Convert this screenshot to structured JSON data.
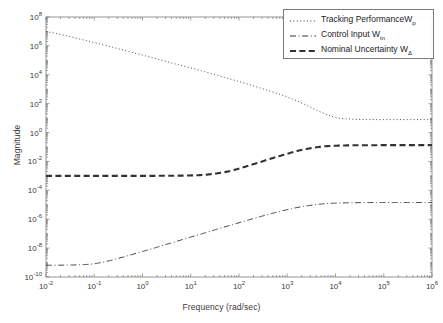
{
  "chart_data": {
    "type": "line",
    "title": "",
    "xlabel": "Frequency (rad/sec)",
    "ylabel": "Magnitude",
    "xscale": "log",
    "yscale": "log",
    "xlim": [
      0.01,
      1000000
    ],
    "ylim": [
      1e-10,
      100000000.0
    ],
    "grid": false,
    "legend_position": "top-right",
    "xticks": [
      {
        "value": 0.01,
        "label_base": "10",
        "label_exp": "-2"
      },
      {
        "value": 0.1,
        "label_base": "10",
        "label_exp": "-1"
      },
      {
        "value": 1,
        "label_base": "10",
        "label_exp": "0"
      },
      {
        "value": 10,
        "label_base": "10",
        "label_exp": "1"
      },
      {
        "value": 100,
        "label_base": "10",
        "label_exp": "2"
      },
      {
        "value": 1000,
        "label_base": "10",
        "label_exp": "3"
      },
      {
        "value": 10000,
        "label_base": "10",
        "label_exp": "4"
      },
      {
        "value": 100000,
        "label_base": "10",
        "label_exp": "5"
      },
      {
        "value": 1000000,
        "label_base": "10",
        "label_exp": "6"
      }
    ],
    "yticks": [
      {
        "value": 100000000.0,
        "label_base": "10",
        "label_exp": "8"
      },
      {
        "value": 1000000.0,
        "label_base": "10",
        "label_exp": "6"
      },
      {
        "value": 10000.0,
        "label_base": "10",
        "label_exp": "4"
      },
      {
        "value": 100.0,
        "label_base": "10",
        "label_exp": "2"
      },
      {
        "value": 1.0,
        "label_base": "10",
        "label_exp": "0"
      },
      {
        "value": 0.01,
        "label_base": "10",
        "label_exp": "-2"
      },
      {
        "value": 0.0001,
        "label_base": "10",
        "label_exp": "-4"
      },
      {
        "value": 1e-06,
        "label_base": "10",
        "label_exp": "-6"
      },
      {
        "value": 1e-08,
        "label_base": "10",
        "label_exp": "-8"
      },
      {
        "value": 1e-10,
        "label_base": "10",
        "label_exp": "-10"
      }
    ],
    "series": [
      {
        "name": "Tracking Performance W_p",
        "legend_text": "Tracking PerformanceW",
        "legend_sub": "p",
        "style": "dotted",
        "color": "#444444",
        "x": [
          0.01,
          0.02,
          0.05,
          0.1,
          0.2,
          0.5,
          1,
          2,
          5,
          10,
          20,
          50,
          100,
          200,
          500,
          1000,
          2000,
          5000,
          10000,
          20000,
          50000,
          100000,
          300000,
          1000000
        ],
        "y": [
          10000000.0,
          6200000.0,
          3000000.0,
          1700000.0,
          950000.0,
          420000.0,
          230000.0,
          125000.0,
          54000.0,
          30000.0,
          16000.0,
          6600.0,
          3400.0,
          1700.0,
          640.0,
          290.0,
          110.0,
          26.0,
          11.0,
          8.6,
          8.0,
          7.9,
          7.9,
          7.9
        ]
      },
      {
        "name": "Control Input W_in",
        "legend_text": "Control Input W",
        "legend_sub": "in",
        "style": "dashdot",
        "color": "#444444",
        "x": [
          0.01,
          0.02,
          0.05,
          0.1,
          0.2,
          0.5,
          1,
          2,
          5,
          10,
          20,
          50,
          100,
          200,
          500,
          1000,
          2000,
          5000,
          10000,
          20000,
          50000,
          100000,
          300000,
          1000000
        ],
        "y": [
          6.5e-10,
          6.6e-10,
          7e-10,
          8.3e-10,
          1.3e-09,
          3e-09,
          5.8e-09,
          1.15e-08,
          2.9e-08,
          5.8e-08,
          1.15e-07,
          2.9e-07,
          5.7e-07,
          1.12e-06,
          2.6e-06,
          4.6e-06,
          7.4e-06,
          1.12e-05,
          1.3e-05,
          1.38e-05,
          1.42e-05,
          1.43e-05,
          1.43e-05,
          1.43e-05
        ]
      },
      {
        "name": "Nominal Uncertainty W_Delta",
        "legend_text": "Nominal Uncertainty W",
        "legend_sub": "Δ",
        "style": "dashed",
        "color": "#333333",
        "x": [
          0.01,
          0.02,
          0.05,
          0.1,
          0.2,
          0.5,
          1,
          2,
          5,
          10,
          20,
          50,
          100,
          200,
          500,
          1000,
          2000,
          5000,
          10000,
          20000,
          50000,
          100000,
          300000,
          1000000
        ],
        "y": [
          0.001,
          0.001,
          0.001,
          0.001,
          0.001,
          0.001,
          0.001,
          0.00101,
          0.00103,
          0.00108,
          0.0012,
          0.0018,
          0.0032,
          0.0065,
          0.017,
          0.034,
          0.063,
          0.105,
          0.122,
          0.13,
          0.133,
          0.134,
          0.134,
          0.134
        ]
      }
    ]
  },
  "legend": {
    "entries": [
      {
        "text": "Tracking PerformanceW",
        "sub": "p",
        "style": "dotted"
      },
      {
        "text": "Control Input W",
        "sub": "in",
        "style": "dashdot"
      },
      {
        "text": "Nominal Uncertainty W",
        "sub": "Δ",
        "style": "dashed"
      }
    ]
  },
  "axes": {
    "xlabel": "Frequency (rad/sec)",
    "ylabel": "Magnitude"
  },
  "colors": {
    "axis": "#7a7a7a",
    "text": "#3a3a3a",
    "curve": "#444444",
    "background": "#ffffff"
  }
}
